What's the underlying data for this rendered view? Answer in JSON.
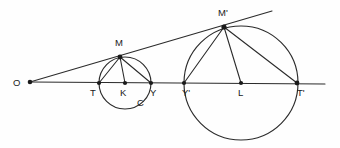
{
  "diagram": {
    "background_color": "#fefefe",
    "stroke_color": "#2b2b2b",
    "label_color": "#1a1a1a",
    "width": 340,
    "height": 148,
    "labels": {
      "o": "O",
      "m": "M",
      "t": "T",
      "k": "K",
      "y": "Y",
      "c": "C",
      "m_prime": "M'",
      "y_prime": "Y'",
      "l": "L",
      "t_prime": "T'"
    },
    "points": [
      {
        "name": "O",
        "label": "O",
        "x": 30,
        "y": 82
      },
      {
        "name": "T",
        "label": "T",
        "x": 99,
        "y": 83
      },
      {
        "name": "K",
        "label": "K",
        "x": 125,
        "y": 83
      },
      {
        "name": "Y",
        "label": "Y",
        "x": 151,
        "y": 83
      },
      {
        "name": "M",
        "label": "M",
        "x": 120,
        "y": 57
      },
      {
        "name": "Y'",
        "label": "Y'",
        "x": 184,
        "y": 83
      },
      {
        "name": "L",
        "label": "L",
        "x": 241,
        "y": 83
      },
      {
        "name": "T'",
        "label": "T'",
        "x": 297,
        "y": 83
      },
      {
        "name": "M'",
        "label": "M'",
        "x": 224,
        "y": 27
      }
    ],
    "circles": [
      {
        "name": "small-circle",
        "center_label": "K",
        "cx": 125,
        "cy": 83,
        "r": 26,
        "arc_label": "C"
      },
      {
        "name": "large-circle",
        "center_label": "L",
        "cx": 241,
        "cy": 83,
        "r": 57
      }
    ],
    "segments": [
      {
        "name": "baseline",
        "from": "O",
        "to": "T'-extended"
      },
      {
        "name": "tangent-ray",
        "from": "O",
        "to": "beyond-M'"
      },
      {
        "name": "chord-M-T",
        "from": "M",
        "to": "T"
      },
      {
        "name": "radius-M-K",
        "from": "M",
        "to": "K"
      },
      {
        "name": "chord-M-Y",
        "from": "M",
        "to": "Y"
      },
      {
        "name": "chord-Mprime-Yprime",
        "from": "M'",
        "to": "Y'"
      },
      {
        "name": "radius-Mprime-L",
        "from": "M'",
        "to": "L"
      },
      {
        "name": "chord-Mprime-Tprime",
        "from": "M'",
        "to": "T'"
      }
    ],
    "label_positions": [
      {
        "key": "o",
        "left": 13,
        "top": 78
      },
      {
        "key": "m",
        "left": 115,
        "top": 38
      },
      {
        "key": "t",
        "left": 90,
        "top": 88
      },
      {
        "key": "k",
        "left": 120,
        "top": 88
      },
      {
        "key": "y",
        "left": 150,
        "top": 88
      },
      {
        "key": "c",
        "left": 137,
        "top": 98
      },
      {
        "key": "m_prime",
        "left": 218,
        "top": 8
      },
      {
        "key": "y_prime",
        "left": 182,
        "top": 88
      },
      {
        "key": "l",
        "left": 238,
        "top": 88
      },
      {
        "key": "t_prime",
        "left": 297,
        "top": 88
      }
    ]
  }
}
